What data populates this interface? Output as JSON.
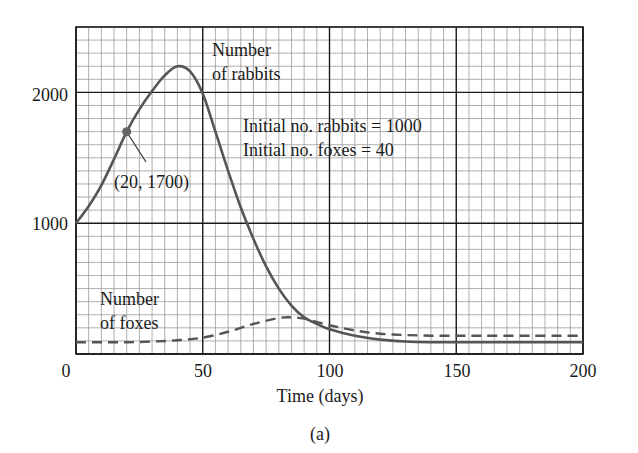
{
  "chart_data": {
    "type": "line",
    "title": "",
    "caption": "(a)",
    "xlabel": "Time (days)",
    "ylabel": "",
    "xlim": [
      0,
      200
    ],
    "ylim": [
      0,
      2500
    ],
    "x_ticks": [
      0,
      50,
      100,
      150,
      200
    ],
    "x_tick_labels": [
      "0",
      "50",
      "100",
      "150",
      "200"
    ],
    "y_ticks": [
      1000,
      2000
    ],
    "y_tick_labels": [
      "1000",
      "2000"
    ],
    "grid": true,
    "minor_grid": {
      "x_step": 5,
      "y_step": 100
    },
    "major_grid": {
      "x_step": 50,
      "y_step": 1000
    },
    "series": [
      {
        "name": "Number of rabbits",
        "style": "solid",
        "color": "#555555",
        "x": [
          0,
          5,
          10,
          15,
          20,
          25,
          30,
          35,
          40,
          45,
          50,
          55,
          60,
          65,
          70,
          75,
          80,
          85,
          90,
          95,
          100,
          110,
          120,
          130,
          140,
          150,
          160,
          180,
          200
        ],
        "values": [
          1000,
          1130,
          1290,
          1490,
          1700,
          1870,
          2010,
          2130,
          2200,
          2160,
          1990,
          1700,
          1400,
          1120,
          880,
          670,
          500,
          370,
          280,
          230,
          190,
          140,
          110,
          95,
          90,
          90,
          90,
          90,
          90
        ]
      },
      {
        "name": "Number of foxes",
        "style": "dashed",
        "color": "#555555",
        "x": [
          0,
          10,
          20,
          30,
          40,
          50,
          60,
          70,
          80,
          85,
          90,
          100,
          110,
          120,
          130,
          140,
          150,
          160,
          180,
          200
        ],
        "values": [
          90,
          90,
          90,
          95,
          105,
          125,
          170,
          230,
          275,
          280,
          270,
          220,
          180,
          155,
          145,
          140,
          140,
          140,
          140,
          140
        ]
      }
    ],
    "annotations": [
      {
        "text": "Number",
        "text2": "of rabbits",
        "x": 57,
        "y": 2290
      },
      {
        "text": "Initial no. rabbits = 1000",
        "x": 69,
        "y": 1850
      },
      {
        "text": "Initial no. foxes = 40",
        "x": 69,
        "y": 1640
      },
      {
        "text": "(20, 1700)",
        "point": [
          20,
          1700
        ],
        "label_x": 20,
        "label_y": 1260
      },
      {
        "text": "Number",
        "text2": "of foxes",
        "x": 9,
        "y": 370
      }
    ]
  },
  "labels": {
    "rabbits_line1": "Number",
    "rabbits_line2": "of rabbits",
    "initial_rabbits": "Initial no. rabbits = 1000",
    "initial_foxes": "Initial no. foxes = 40",
    "point_label": "(20, 1700)",
    "foxes_line1": "Number",
    "foxes_line2": "of foxes",
    "xlabel": "Time (days)",
    "caption": "(a)",
    "ytick_2000": "2000",
    "ytick_1000": "1000",
    "xtick_0": "0",
    "xtick_50": "50",
    "xtick_100": "100",
    "xtick_150": "150",
    "xtick_200": "200"
  },
  "colors": {
    "curve": "#555555",
    "minor_grid": "#9a9a9a",
    "major_grid": "#1a1a1a",
    "point": "#666666"
  }
}
